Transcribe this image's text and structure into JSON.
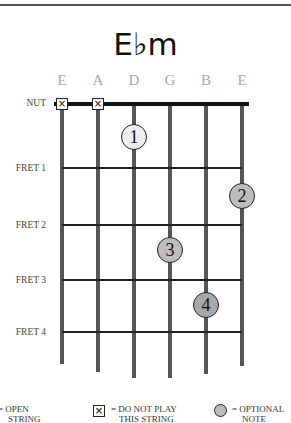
{
  "chord": {
    "name": "E♭m"
  },
  "strings": [
    "E",
    "A",
    "D",
    "G",
    "B",
    "E"
  ],
  "row_labels": {
    "nut": "NUT",
    "fret1": "FRET 1",
    "fret2": "FRET 2",
    "fret3": "FRET 3",
    "fret4": "FRET 4"
  },
  "muted_strings": [
    1,
    2
  ],
  "fingers": [
    {
      "finger": "1",
      "string": 3,
      "fret": 1,
      "fill": "#eeeeee"
    },
    {
      "finger": "2",
      "string": 6,
      "fret": 2,
      "fill": "#bdbdbd"
    },
    {
      "finger": "3",
      "string": 4,
      "fret": 3,
      "fill": "#bdbdbd"
    },
    {
      "finger": "4",
      "string": 5,
      "fret": 4,
      "fill": "#a8a8a8"
    }
  ],
  "mute_symbol": "☒",
  "legend": {
    "open": "= OPEN\nSTRING",
    "open_line1": "= OPEN",
    "open_line2": "STRING",
    "mute_line1": "= DO NOT PLAY",
    "mute_line2": "THIS STRING",
    "optional_line1": "= OPTIONAL",
    "optional_line2": "NOTE",
    "mute_glyph": "×",
    "optional_color": "#bdbdbd"
  }
}
